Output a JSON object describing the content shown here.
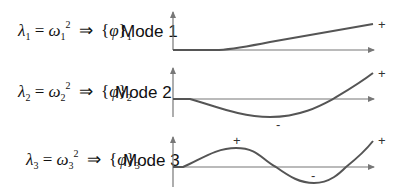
{
  "modes": [
    {
      "index": "1",
      "label": "Mode 1",
      "lambda": "λ",
      "omega": "ω",
      "power": "2",
      "implies": "⇒",
      "phi": "φ",
      "end_sign": "+",
      "signs": []
    },
    {
      "index": "2",
      "label": "Mode 2",
      "lambda": "λ",
      "omega": "ω",
      "power": "2",
      "implies": "⇒",
      "phi": "φ",
      "end_sign": "+",
      "signs": [
        "-"
      ]
    },
    {
      "index": "3",
      "label": "Mode 3",
      "lambda": "λ",
      "omega": "ω",
      "power": "2",
      "implies": "⇒",
      "phi": "φ",
      "end_sign": "+",
      "signs": [
        "+",
        "-"
      ]
    }
  ],
  "colors": {
    "axis": "#777777",
    "curve": "#555555",
    "text": "#111111"
  }
}
